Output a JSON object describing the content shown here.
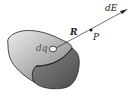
{
  "diagram": {
    "labels": {
      "charge_element": "dq",
      "distance_vector": "R",
      "field_point": "P",
      "field_vector": "dE"
    },
    "colors": {
      "body_light": "#e2e2e2",
      "body_dark": "#5a5a5a",
      "stroke": "#222222",
      "background": "#ffffff"
    },
    "points": {
      "dq": [
        53,
        49
      ],
      "P": [
        91,
        30
      ],
      "arrow_tip": [
        128,
        9
      ]
    }
  }
}
